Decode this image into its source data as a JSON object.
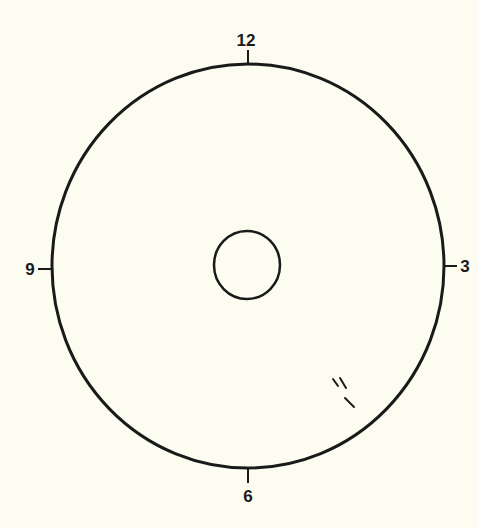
{
  "diagram": {
    "type": "clock-face",
    "background_color": "#fdfcf0",
    "stroke_color": "#1a1a1a",
    "outer_circle": {
      "cx": 248,
      "cy": 266,
      "rx": 196,
      "ry": 202,
      "stroke_width": 3
    },
    "inner_circle": {
      "cx": 247,
      "cy": 265,
      "rx": 33,
      "ry": 34,
      "stroke_width": 2.5
    },
    "hour_markers": [
      {
        "label": "12",
        "position": "top",
        "tick": {
          "x1": 248,
          "y1": 50,
          "x2": 248,
          "y2": 64
        },
        "label_x": 246,
        "label_y": 46
      },
      {
        "label": "3",
        "position": "right",
        "tick": {
          "x1": 444,
          "y1": 266,
          "x2": 457,
          "y2": 266
        },
        "label_x": 465,
        "label_y": 272
      },
      {
        "label": "6",
        "position": "bottom",
        "tick": {
          "x1": 248,
          "y1": 469,
          "x2": 248,
          "y2": 483
        },
        "label_x": 248,
        "label_y": 502
      },
      {
        "label": "9",
        "position": "left",
        "tick": {
          "x1": 38,
          "y1": 269,
          "x2": 52,
          "y2": 269
        },
        "label_x": 30,
        "label_y": 275
      }
    ],
    "marks": [
      {
        "x1": 333,
        "y1": 379,
        "x2": 338,
        "y2": 386
      },
      {
        "x1": 340,
        "y1": 378,
        "x2": 346,
        "y2": 388
      },
      {
        "x1": 345,
        "y1": 398,
        "x2": 354,
        "y2": 407
      }
    ]
  }
}
